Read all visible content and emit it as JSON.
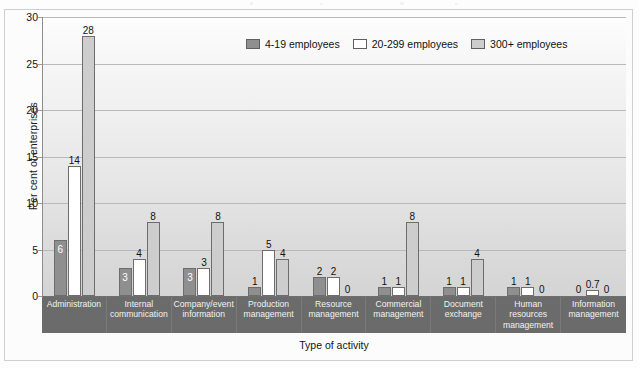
{
  "chart_data": {
    "type": "bar",
    "title": "",
    "xlabel": "Type of activity",
    "ylabel": "Per cent of enterprises",
    "ylim": [
      0,
      30
    ],
    "yticks": [
      0,
      5,
      10,
      15,
      20,
      25,
      30
    ],
    "grid": true,
    "legend_position": "top-center",
    "categories": [
      "Administration",
      "Internal communication",
      "Company/event information",
      "Production management",
      "Resource management",
      "Commercial management",
      "Document exchange",
      "Human resources management",
      "Information management"
    ],
    "series": [
      {
        "name": "4-19 employees",
        "color": "#8f8f8f",
        "values": [
          6,
          3,
          3,
          1,
          2,
          1,
          1,
          1,
          0
        ]
      },
      {
        "name": "20-299 employees",
        "color": "#ffffff",
        "values": [
          14,
          4,
          3,
          5,
          2,
          1,
          1,
          1,
          0.7
        ]
      },
      {
        "name": "300+ employees",
        "color": "#cdcdcd",
        "values": [
          28,
          8,
          8,
          4,
          0,
          8,
          4,
          0,
          0
        ]
      }
    ],
    "data_labels": [
      [
        "6",
        "14",
        "28"
      ],
      [
        "3",
        "4",
        "8"
      ],
      [
        "3",
        "3",
        "8"
      ],
      [
        "1",
        "5",
        "4"
      ],
      [
        "2",
        "2",
        "0"
      ],
      [
        "1",
        "1",
        "8"
      ],
      [
        "1",
        "1",
        "4"
      ],
      [
        "1",
        "1",
        "0"
      ],
      [
        "0",
        "0.7",
        "0"
      ]
    ]
  },
  "legend": {
    "items": [
      {
        "label": "4-19 employees"
      },
      {
        "label": "20-299 employees"
      },
      {
        "label": "300+ employees"
      }
    ]
  },
  "axis": {
    "y_title": "Per cent of enterprises",
    "x_title": "Type of activity"
  }
}
